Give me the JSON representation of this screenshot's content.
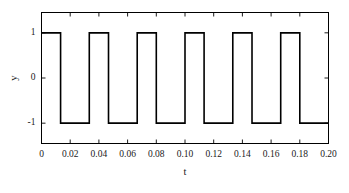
{
  "chart_data": {
    "type": "line",
    "title": "",
    "subtitle": "",
    "xlabel": "t",
    "ylabel": "y",
    "xlim": [
      0,
      0.2
    ],
    "ylim": [
      -1.45,
      1.45
    ],
    "xticks": [
      0,
      0.02,
      0.04,
      0.06,
      0.08,
      0.1,
      0.12,
      0.14,
      0.16,
      0.18,
      0.2
    ],
    "xticklabels": [
      "0",
      "0.02",
      "0.04",
      "0.06",
      "0.08",
      "0.10",
      "0.12",
      "0.14",
      "0.16",
      "0.18",
      "0.20"
    ],
    "yticks": [
      1,
      0,
      -1
    ],
    "yticklabels": [
      "1",
      "0",
      "-1"
    ],
    "grid": false,
    "legend": null,
    "series": [
      {
        "name": "square wave",
        "color": "#000000",
        "linewidth": 1.6,
        "description": "Square wave, amplitude +/-1, period 0.03333 s (30 Hz), duty cycle 40%, starts high at t=0",
        "waveform": {
          "amplitude_high": 1,
          "amplitude_low": -1,
          "period": 0.03333,
          "frequency_hz": 30,
          "duty_cycle": 0.4,
          "phase_start": "high"
        },
        "points": [
          [
            0.0,
            1
          ],
          [
            0.0133,
            1
          ],
          [
            0.0133,
            -1
          ],
          [
            0.0333,
            -1
          ],
          [
            0.0333,
            1
          ],
          [
            0.0467,
            1
          ],
          [
            0.0467,
            -1
          ],
          [
            0.0667,
            -1
          ],
          [
            0.0667,
            1
          ],
          [
            0.08,
            1
          ],
          [
            0.08,
            -1
          ],
          [
            0.1,
            -1
          ],
          [
            0.1,
            1
          ],
          [
            0.1133,
            1
          ],
          [
            0.1133,
            -1
          ],
          [
            0.1333,
            -1
          ],
          [
            0.1333,
            1
          ],
          [
            0.1467,
            1
          ],
          [
            0.1467,
            -1
          ],
          [
            0.1667,
            -1
          ],
          [
            0.1667,
            1
          ],
          [
            0.18,
            1
          ],
          [
            0.18,
            -1
          ],
          [
            0.2,
            -1
          ]
        ]
      }
    ]
  },
  "axes": {
    "frame_color": "#000000",
    "tick_direction": "in"
  }
}
